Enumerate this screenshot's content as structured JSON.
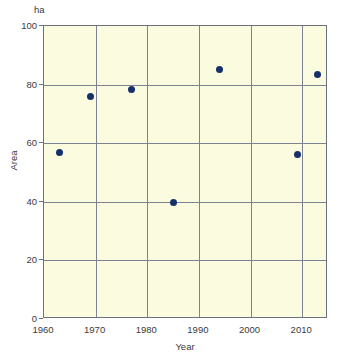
{
  "chart_data": {
    "type": "scatter",
    "title": "",
    "subtitle": "",
    "xlabel": "Year",
    "ylabel": "Area",
    "unit_label": "ha",
    "xlim": [
      1960,
      2015
    ],
    "ylim": [
      0,
      100
    ],
    "xticks": [
      1960,
      1970,
      1980,
      1990,
      2000,
      2010
    ],
    "xtick_labels": [
      "1960",
      "1970",
      "1980",
      "1990",
      "2000",
      "2010"
    ],
    "yticks": [
      0,
      20,
      40,
      60,
      80,
      100
    ],
    "ytick_labels": [
      "0",
      "20",
      "40",
      "60",
      "80",
      "100"
    ],
    "grid": true,
    "legend": "none",
    "marker": "filled-circle",
    "marker_color": "#16306b",
    "plot_background": "#fbfbe0",
    "grid_color": "#7d8293",
    "axis_color": "#6b6f80",
    "series": [
      {
        "name": "Area",
        "points": [
          {
            "x": 1963,
            "y": 56.7
          },
          {
            "x": 1969,
            "y": 76.1
          },
          {
            "x": 1977,
            "y": 78.2
          },
          {
            "x": 1985,
            "y": 39.8
          },
          {
            "x": 1994,
            "y": 85.3
          },
          {
            "x": 2009,
            "y": 56.3
          },
          {
            "x": 2013,
            "y": 83.6
          }
        ]
      }
    ]
  }
}
